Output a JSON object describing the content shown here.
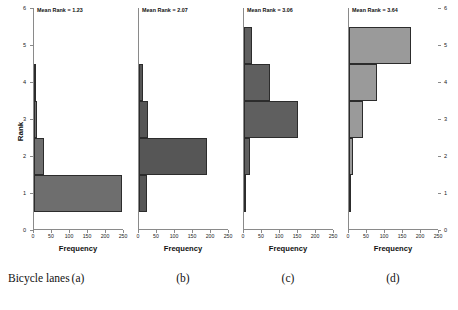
{
  "figure": {
    "series_label": "Bicycle lanes",
    "yaxis_title": "Rank",
    "xaxis_title": "Frequency",
    "y_ticks": [
      0,
      1,
      2,
      3,
      4,
      5,
      6
    ],
    "x_ticks": [
      0,
      50,
      100,
      150,
      200,
      250
    ],
    "xlim": [
      0,
      250
    ],
    "ylim": [
      0,
      6
    ],
    "mean_prefix": "Mean Rank = "
  },
  "chart_data": {
    "type": "bar",
    "orientation": "horizontal",
    "title": "",
    "xlabel": "Frequency",
    "ylabel": "Rank",
    "xlim": [
      0,
      250
    ],
    "ylim": [
      0,
      6
    ],
    "grid": false,
    "legend": false,
    "categories": [
      1,
      2,
      3,
      4,
      5,
      6
    ],
    "panels": [
      {
        "caption": "(a)",
        "mean_rank": "1.23",
        "color": "#6e6e6e",
        "edge_color": "#2c2c2c",
        "bins": [
          {
            "rank": 1,
            "frequency": 245
          },
          {
            "rank": 2,
            "frequency": 28
          },
          {
            "rank": 3,
            "frequency": 9
          },
          {
            "rank": 4,
            "frequency": 4
          }
        ]
      },
      {
        "caption": "(b)",
        "mean_rank": "2.07",
        "color": "#565656",
        "edge_color": "#2c2c2c",
        "bins": [
          {
            "rank": 1,
            "frequency": 22
          },
          {
            "rank": 2,
            "frequency": 190
          },
          {
            "rank": 3,
            "frequency": 26
          },
          {
            "rank": 4,
            "frequency": 10
          }
        ]
      },
      {
        "caption": "(c)",
        "mean_rank": "3.06",
        "color": "#5f5f5f",
        "edge_color": "#2c2c2c",
        "bins": [
          {
            "rank": 1,
            "frequency": 2
          },
          {
            "rank": 2,
            "frequency": 18
          },
          {
            "rank": 3,
            "frequency": 150
          },
          {
            "rank": 4,
            "frequency": 72
          },
          {
            "rank": 5,
            "frequency": 22
          }
        ]
      },
      {
        "caption": "(d)",
        "mean_rank": "3.64",
        "color": "#9a9a9a",
        "edge_color": "#2c2c2c",
        "bins": [
          {
            "rank": 1,
            "frequency": 2
          },
          {
            "rank": 2,
            "frequency": 12
          },
          {
            "rank": 3,
            "frequency": 40
          },
          {
            "rank": 4,
            "frequency": 78
          },
          {
            "rank": 5,
            "frequency": 172
          }
        ]
      }
    ]
  }
}
